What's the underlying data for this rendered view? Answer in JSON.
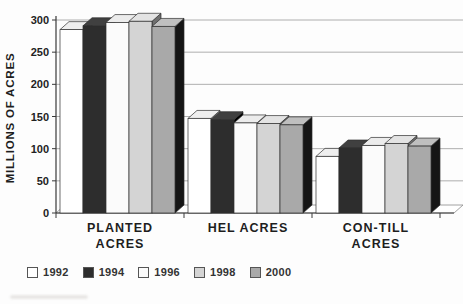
{
  "chart_data": {
    "type": "bar",
    "subtype": "3d-clustered-column",
    "title": "",
    "ylabel": "MILLIONS OF ACRES",
    "xlabel": "",
    "ylim": [
      0,
      300
    ],
    "yticks": [
      0,
      50,
      100,
      150,
      200,
      250,
      300
    ],
    "grid": true,
    "legend_position": "bottom-left",
    "categories": [
      {
        "label": "PLANTED ACRES",
        "lines": [
          "PLANTED",
          "ACRES"
        ]
      },
      {
        "label": "HEL ACRES",
        "lines": [
          "HEL ACRES"
        ]
      },
      {
        "label": "CON-TILL ACRES",
        "lines": [
          "CON-TILL",
          "ACRES"
        ]
      }
    ],
    "series": [
      {
        "name": "1992",
        "fill": "#ffffff",
        "top": "#efefef",
        "side": "#9a9a9a",
        "values": [
          285,
          147,
          88
        ]
      },
      {
        "name": "1994",
        "fill": "#2d2d2d",
        "top": "#404040",
        "side": "#000000",
        "values": [
          291,
          145,
          101
        ]
      },
      {
        "name": "1996",
        "fill": "#fbfbfb",
        "top": "#ececec",
        "side": "#949494",
        "values": [
          296,
          140,
          105
        ]
      },
      {
        "name": "1998",
        "fill": "#d4d4d4",
        "top": "#e3e3e3",
        "side": "#6e6e6e",
        "values": [
          298,
          139,
          108
        ]
      },
      {
        "name": "2000",
        "fill": "#a9a9a9",
        "top": "#bfbfbf",
        "side": "#151515",
        "values": [
          290,
          137,
          104
        ]
      }
    ],
    "axis_color": "#3a3a3a",
    "gridline_color": "#9a9a9a",
    "outline_color": "#2f2f2f"
  }
}
